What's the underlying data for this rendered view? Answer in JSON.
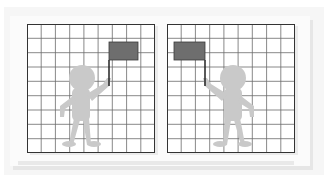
{
  "figure": {
    "panels": [
      {
        "id": "left",
        "grid": {
          "cols": 9,
          "rows": 9
        },
        "flag_side": "right",
        "person_facing": "right-raised-arm"
      },
      {
        "id": "right",
        "grid": {
          "cols": 9,
          "rows": 9
        },
        "flag_side": "left",
        "person_facing": "left-raised-arm"
      }
    ],
    "colors": {
      "grid_line": "#555555",
      "grid_border": "#333333",
      "person": "#c8c8c8",
      "flag": "#6e6e6e",
      "flag_border": "#3a3a3a",
      "pole": "#2a2a2a",
      "background": "#f6f6f6"
    }
  }
}
